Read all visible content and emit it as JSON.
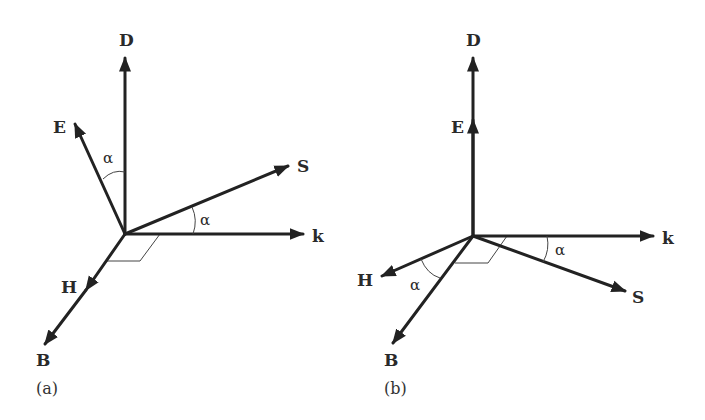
{
  "figure": {
    "panels": [
      {
        "id": "a",
        "caption": "(a)",
        "vectors": [
          {
            "name": "D",
            "label": "D"
          },
          {
            "name": "E",
            "label": "E"
          },
          {
            "name": "S",
            "label": "S"
          },
          {
            "name": "k",
            "label": "k"
          },
          {
            "name": "H",
            "label": "H"
          },
          {
            "name": "B",
            "label": "B"
          }
        ],
        "angles": [
          {
            "between": "E-D",
            "label": "α"
          },
          {
            "between": "S-k",
            "label": "α"
          }
        ],
        "notes": "D vertical, E tilted from D by α; S tilted from k by α; H and B collinear"
      },
      {
        "id": "b",
        "caption": "(b)",
        "vectors": [
          {
            "name": "D",
            "label": "D"
          },
          {
            "name": "E",
            "label": "E"
          },
          {
            "name": "k",
            "label": "k"
          },
          {
            "name": "S",
            "label": "S"
          },
          {
            "name": "H",
            "label": "H"
          },
          {
            "name": "B",
            "label": "B"
          }
        ],
        "angles": [
          {
            "between": "H-B",
            "label": "α"
          },
          {
            "between": "k-S",
            "label": "α"
          }
        ],
        "notes": "D and E collinear vertical; S tilted below k by α; H and B separated by α"
      }
    ]
  },
  "colors": {
    "ink": "#222222",
    "background": "#ffffff"
  }
}
